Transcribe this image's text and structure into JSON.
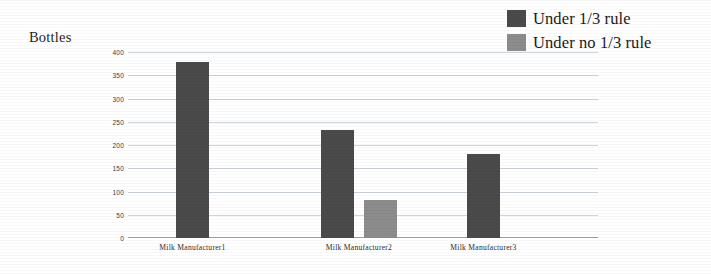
{
  "chart_data": {
    "type": "bar",
    "title": "",
    "ylabel": "Bottles",
    "xlabel": "",
    "categories": [
      "Milk Manufacturer1",
      "Milk Manufacturer2",
      "Milk Manufacturer3"
    ],
    "series": [
      {
        "name": "Under 1/3 rule",
        "color": "#4a4a4a",
        "values": [
          378,
          232,
          180
        ]
      },
      {
        "name": "Under no 1/3 rule",
        "color": "#8c8c8c",
        "values": [
          null,
          82,
          null
        ]
      }
    ],
    "ylim": [
      0,
      400
    ],
    "yticks": [
      400,
      350,
      300,
      250,
      200,
      150,
      100,
      50,
      0
    ],
    "ytick_labels": [
      "400",
      "350",
      "300",
      "250",
      "200",
      "150",
      "100",
      "50",
      "0"
    ],
    "grid": true,
    "legend_position": "top-right",
    "gridline_color": "#c3cbd4",
    "background": "#ffffff"
  },
  "legend": {
    "items": [
      {
        "label": "Under 1/3 rule",
        "color": "#4a4a4a"
      },
      {
        "label": "Under no 1/3 rule",
        "color": "#8c8c8c"
      }
    ]
  }
}
